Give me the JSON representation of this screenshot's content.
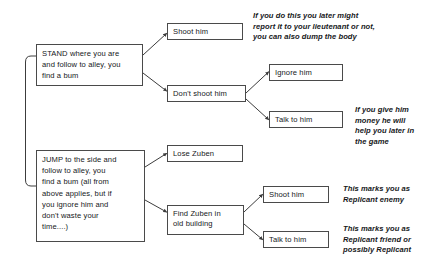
{
  "diagram": {
    "style": {
      "box_border_color": "#4a4a4a",
      "box_fill_color": "#ffffff",
      "connector_color": "#3c3c3c",
      "text_color": "#16181a",
      "background_color": "#ffffff"
    },
    "nodes": [
      {
        "id": "stand",
        "label": "STAND where you are and follow to alley, you find a bum",
        "lines": [
          "STAND where you are",
          "and follow to alley, you",
          "find a bum"
        ]
      },
      {
        "id": "shoot-him-top",
        "label": "Shoot him",
        "lines": [
          "Shoot him"
        ]
      },
      {
        "id": "dont-shoot-him",
        "label": "Don't shoot him",
        "lines": [
          "Don't shoot him"
        ]
      },
      {
        "id": "ignore-him",
        "label": "Ignore him",
        "lines": [
          "Ignore him"
        ]
      },
      {
        "id": "talk-to-him-top",
        "label": "Talk to him",
        "lines": [
          "Talk to him"
        ]
      },
      {
        "id": "jump",
        "label": "JUMP to the side and follow to alley, you find a bum (all from above applies, but if you ignore him and don't waste your time...)",
        "lines": [
          "JUMP to the side and",
          "follow to alley, you",
          "find a bum (all from",
          "above applies, but if",
          "you ignore him and",
          "don't waste your",
          "time....)"
        ]
      },
      {
        "id": "lose-zuben",
        "label": "Lose Zuben",
        "lines": [
          "Lose Zuben"
        ]
      },
      {
        "id": "find-zuben",
        "label": "Find Zuben in old building",
        "lines": [
          "Find Zuben in",
          "old building"
        ]
      },
      {
        "id": "shoot-him-bottom",
        "label": "Shoot him",
        "lines": [
          "Shoot him"
        ]
      },
      {
        "id": "talk-to-him-bottom",
        "label": "Talk to him",
        "lines": [
          "Talk to him"
        ]
      }
    ],
    "notes": [
      {
        "id": "note-shoot-him",
        "text": "If you do this you later might report it to your lieutenant or not, you can also dump the body",
        "lines": [
          "If you do this you later might",
          "report it to your lieutenant or not,",
          "you can also dump the body"
        ]
      },
      {
        "id": "note-talk-to-him",
        "text": "If you give him money he will help you later in the game",
        "lines": [
          "If you give him",
          "money he will",
          "help you later in",
          "the game"
        ]
      },
      {
        "id": "note-replicant-enemy",
        "text": "This marks you as Replicant enemy",
        "lines": [
          "This marks you as",
          "Replicant enemy"
        ]
      },
      {
        "id": "note-replicant-friend",
        "text": "This marks you as Replicant friend or possibly Replicant",
        "lines": [
          "This marks you as",
          "Replicant friend or",
          "possibly  Replicant"
        ]
      }
    ]
  }
}
